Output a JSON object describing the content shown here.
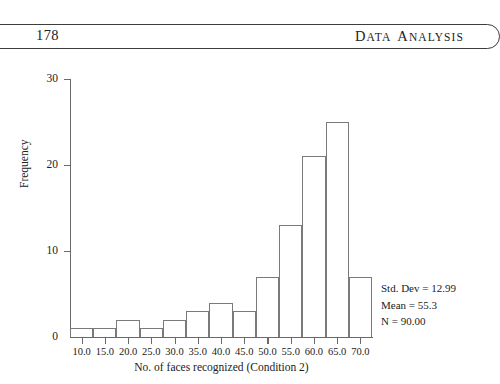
{
  "header": {
    "page_number": "178",
    "title_first_word_cap": "D",
    "title_first_word_rest": "ATA",
    "title_second_word_cap": "A",
    "title_second_word_rest": "NALYSIS"
  },
  "chart_data": {
    "type": "bar",
    "title": "",
    "subtitle": "",
    "xlabel": "No. of faces recognized (Condition 2)",
    "ylabel": "Frequency",
    "categories": [
      "10.0",
      "15.0",
      "20.0",
      "25.0",
      "30.0",
      "35.0",
      "40.0",
      "45.0",
      "50.0",
      "55.0",
      "60.0",
      "65.0",
      "70.0"
    ],
    "values": [
      1,
      1,
      2,
      1,
      2,
      3,
      4,
      3,
      7,
      13,
      21,
      25,
      7
    ],
    "xlim": [
      7.5,
      72.5
    ],
    "ylim": [
      0,
      30
    ],
    "x_ticks": [
      "10.0",
      "15.0",
      "20.0",
      "25.0",
      "30.0",
      "35.0",
      "40.0",
      "45.0",
      "50.0",
      "55.0",
      "60.0",
      "65.0",
      "70.0"
    ],
    "y_ticks": [
      "0",
      "10",
      "20",
      "30"
    ],
    "y_tick_values": [
      0,
      10,
      20,
      30
    ],
    "grid": false,
    "legend": false,
    "bar_style": "histogram-outline",
    "bar_fill": "#ffffff",
    "bar_edge": "#7a7a7a",
    "axis_color": "#6a6a6a"
  },
  "stats": {
    "std_dev_label": "Std. Dev = 12.99",
    "mean_label": "Mean = 55.3",
    "n_label": "N = 90.00",
    "std_dev": 12.99,
    "mean": 55.3,
    "n": 90.0
  }
}
